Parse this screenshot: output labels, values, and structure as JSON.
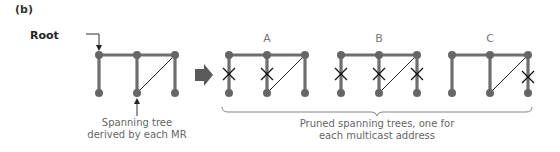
{
  "panel_label": "(b)",
  "root_label": "Root",
  "left_caption": {
    "line1": "Spanning tree",
    "line2": "derived by each MR"
  },
  "trees": [
    {
      "letter": "A",
      "pruned_links": [
        "left-vertical",
        "middle-vertical"
      ]
    },
    {
      "letter": "B",
      "pruned_links": [
        "left-vertical",
        "middle-vertical",
        "right-vertical"
      ]
    },
    {
      "letter": "C",
      "pruned_links": [
        "right-vertical"
      ]
    }
  ],
  "right_caption": {
    "line1": "Pruned spanning trees, one for",
    "line2": "each multicast address"
  },
  "colors": {
    "edge": "#6e6e6e",
    "node": "#666666",
    "arrow": "#5a5a5a",
    "cross": "#111111",
    "text": "#666666"
  }
}
